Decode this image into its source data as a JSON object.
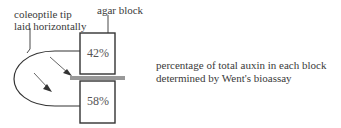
{
  "labels": {
    "coleoptile_line1": "coleoptile tip",
    "coleoptile_line2": "laid horizontally",
    "agar_block": "agar block",
    "caption_line1": "percentage of total auxin in each block",
    "caption_line2": "determined by Went's bioassay"
  },
  "blocks": {
    "top_percent": "42%",
    "bottom_percent": "58%"
  }
}
